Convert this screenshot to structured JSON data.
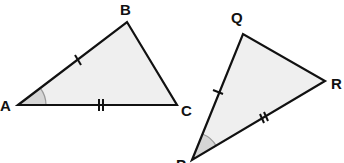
{
  "diagram": {
    "type": "congruent-triangles",
    "style": {
      "stroke_color": "#111111",
      "fill_color": "#efefef",
      "angle_fill_color": "#d6d6d6",
      "angle_arc_color": "#9a9a9a",
      "background": "#ffffff"
    },
    "triangles": [
      {
        "name": "ABC",
        "vertices": [
          {
            "label": "A",
            "x": 18,
            "y": 105,
            "label_x": 0,
            "label_y": 111
          },
          {
            "label": "B",
            "x": 127,
            "y": 22,
            "label_x": 120,
            "label_y": 15
          },
          {
            "label": "C",
            "x": 177,
            "y": 105,
            "label_x": 181,
            "label_y": 116
          }
        ],
        "marked_angle": "A",
        "side_marks": [
          {
            "side": "AB",
            "ticks": 1
          },
          {
            "side": "AC",
            "ticks": 2
          }
        ]
      },
      {
        "name": "PQR",
        "vertices": [
          {
            "label": "P",
            "x": 192,
            "y": 160,
            "label_x": 176,
            "label_y": 170
          },
          {
            "label": "Q",
            "x": 243,
            "y": 34,
            "label_x": 231,
            "label_y": 23
          },
          {
            "label": "R",
            "x": 325,
            "y": 81,
            "label_x": 331,
            "label_y": 89
          }
        ],
        "marked_angle": "P",
        "side_marks": [
          {
            "side": "PQ",
            "ticks": 1
          },
          {
            "side": "PR",
            "ticks": 2
          }
        ]
      }
    ]
  }
}
